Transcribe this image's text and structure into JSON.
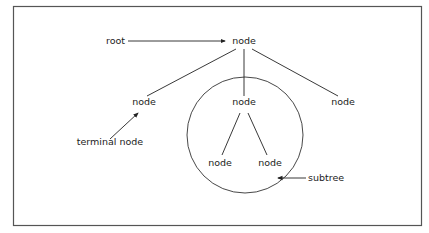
{
  "diagram": {
    "type": "tree",
    "labels": {
      "root_annotation": "root",
      "root_node": "node",
      "left_child": "node",
      "middle_child": "node",
      "right_child": "node",
      "grandchild_left": "node",
      "grandchild_right": "node",
      "terminal_annotation": "terminal node",
      "subtree_annotation": "subtree"
    },
    "colors": {
      "stroke": "#222222",
      "frame": "#555555",
      "background": "#ffffff"
    }
  }
}
